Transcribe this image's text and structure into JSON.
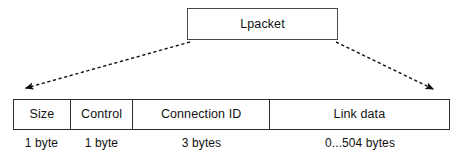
{
  "diagram": {
    "background_color": "#ffffff",
    "line_color": "#2e2e2e",
    "text_color": "#111111"
  },
  "top_block": {
    "label": "Lpacket"
  },
  "connectors": [
    {
      "name": "left-expansion-arrow",
      "style": "dashed",
      "from": {
        "x": 190,
        "y": 42
      },
      "to": {
        "x": 22,
        "y": 89
      },
      "arrowhead": "end"
    },
    {
      "name": "right-expansion-arrow",
      "style": "dashed",
      "from": {
        "x": 336,
        "y": 42
      },
      "to": {
        "x": 437,
        "y": 91
      },
      "arrowhead": "end"
    }
  ],
  "packet_fields": [
    {
      "name": "Size",
      "size": "1 byte"
    },
    {
      "name": "Control",
      "size": "1 byte"
    },
    {
      "name": "Connection ID",
      "size": "3 bytes"
    },
    {
      "name": "Link data",
      "size": "0...504 bytes"
    }
  ]
}
